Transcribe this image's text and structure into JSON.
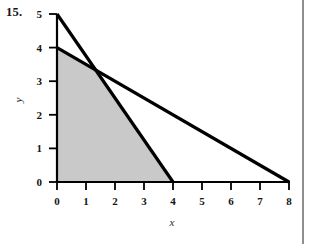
{
  "figure": {
    "problem_number": "15.",
    "background_color": "#ffffff",
    "shade_color": "#c9c9c9",
    "line_color": "#000000",
    "axis_color": "#000000",
    "rule_color": "#8e8e8e"
  },
  "chart_data": {
    "type": "line",
    "title": "",
    "subtitle": "",
    "xlabel": "x",
    "ylabel": "y",
    "xlim": [
      0,
      8
    ],
    "ylim": [
      0,
      5
    ],
    "xticks": [
      0,
      1,
      2,
      3,
      4,
      5,
      6,
      7,
      8
    ],
    "xtick_labels": [
      "0",
      "1",
      "2",
      "3",
      "4",
      "5",
      "6",
      "7",
      "8"
    ],
    "yticks": [
      0,
      1,
      2,
      3,
      4,
      5
    ],
    "ytick_labels": [
      "0",
      "1",
      "2",
      "3",
      "4",
      "5"
    ],
    "grid": false,
    "legend": null,
    "series": [
      {
        "name": "line-1",
        "x": [
          0,
          4
        ],
        "y": [
          5,
          0
        ],
        "intercepts": {
          "y_intercept": 5,
          "x_intercept": 4
        },
        "style": "solid-thick"
      },
      {
        "name": "line-2",
        "x": [
          0,
          8
        ],
        "y": [
          4,
          0
        ],
        "intercepts": {
          "y_intercept": 4,
          "x_intercept": 8
        },
        "style": "solid-thick"
      }
    ],
    "intersection_point": {
      "x": 1.3333,
      "y": 3.3333
    },
    "shaded_region": {
      "label": "feasible-region",
      "fill": "#c9c9c9",
      "vertices": [
        {
          "x": 0,
          "y": 0
        },
        {
          "x": 0,
          "y": 4
        },
        {
          "x": 1.3333,
          "y": 3.3333
        },
        {
          "x": 4,
          "y": 0
        }
      ]
    },
    "annotations": []
  }
}
